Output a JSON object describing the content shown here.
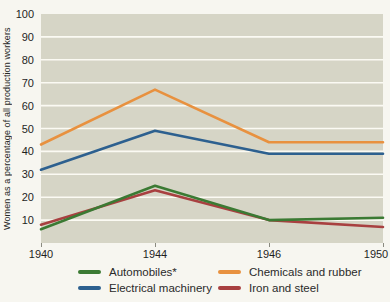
{
  "page": {
    "background_color": "#f7f6f0"
  },
  "chart_data": {
    "type": "line",
    "title": "",
    "xlabel": "",
    "ylabel": "Women as a percentage of all production workers",
    "categories": [
      "1940",
      "1944",
      "1946",
      "1950"
    ],
    "series": [
      {
        "name": "Automobiles*",
        "color": "#3b7a33",
        "values": [
          6,
          25,
          10,
          11
        ]
      },
      {
        "name": "Electrical machinery",
        "color": "#2d608f",
        "values": [
          32,
          49,
          39,
          39
        ]
      },
      {
        "name": "Chemicals and rubber",
        "color": "#e8913f",
        "values": [
          43,
          67,
          44,
          44
        ]
      },
      {
        "name": "Iron and steel",
        "color": "#a84040",
        "values": [
          8,
          23,
          10,
          7
        ]
      }
    ],
    "ylim": [
      0,
      100
    ],
    "ytick_step": 10,
    "ytick_labels": [
      "10",
      "20",
      "30",
      "40",
      "50",
      "60",
      "70",
      "80",
      "90",
      "100"
    ],
    "grid": "horizontal",
    "gridline_color": "#fbfaf3",
    "plot_background": "#d6d5c6",
    "legend_position": "bottom-two-columns",
    "legend_columns": [
      [
        "Automobiles*",
        "Electrical machinery"
      ],
      [
        "Chemicals and rubber",
        "Iron and steel"
      ]
    ]
  }
}
